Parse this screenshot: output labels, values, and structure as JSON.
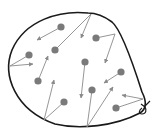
{
  "diagram": {
    "colors": {
      "background": "#ffffff",
      "balloon_outline": "#1a1a1a",
      "particle": "#7a7a7a",
      "arrow": "#8a8a8a"
    },
    "balloon": {
      "outline_path": "M 88,13 C 60,10 25,20 12,50 C 2,75 15,110 55,124 C 80,130 115,126 140,113 C 148,108 145,98 142,92 C 135,70 122,30 112,22 C 104,16 96,13 88,13 Z",
      "knot": {
        "x": 144,
        "y": 108
      }
    },
    "particles": [
      {
        "id": "A",
        "x": 61,
        "y": 27,
        "path": [
          [
            61,
            27
          ],
          [
            37,
            40
          ]
        ]
      },
      {
        "id": "B",
        "x": 55,
        "y": 50,
        "path": [
          [
            55,
            50
          ],
          [
            91,
            14
          ],
          [
            81,
            38
          ]
        ]
      },
      {
        "id": "C",
        "x": 96,
        "y": 38,
        "path": [
          [
            96,
            38
          ],
          [
            115,
            34
          ],
          [
            105,
            63
          ]
        ]
      },
      {
        "id": "D",
        "x": 29,
        "y": 55,
        "path": [
          [
            29,
            55
          ],
          [
            10,
            66
          ],
          [
            33,
            64
          ]
        ]
      },
      {
        "id": "E",
        "x": 38,
        "y": 81,
        "path": [
          [
            38,
            81
          ],
          [
            48,
            56
          ]
        ]
      },
      {
        "id": "F",
        "x": 85,
        "y": 62,
        "path": [
          [
            85,
            62
          ],
          [
            81,
            98
          ]
        ]
      },
      {
        "id": "G",
        "x": 121,
        "y": 72,
        "path": [
          [
            121,
            72
          ],
          [
            104,
            83
          ]
        ]
      },
      {
        "id": "H",
        "x": 64,
        "y": 102,
        "path": [
          [
            64,
            102
          ],
          [
            44,
            120
          ],
          [
            54,
            80
          ]
        ]
      },
      {
        "id": "I",
        "x": 92,
        "y": 90,
        "path": [
          [
            92,
            90
          ],
          [
            87,
            127
          ],
          [
            113,
            87
          ]
        ]
      },
      {
        "id": "J",
        "x": 116,
        "y": 108,
        "path": [
          [
            116,
            108
          ],
          [
            143,
            99
          ],
          [
            122,
            95
          ]
        ]
      }
    ]
  }
}
